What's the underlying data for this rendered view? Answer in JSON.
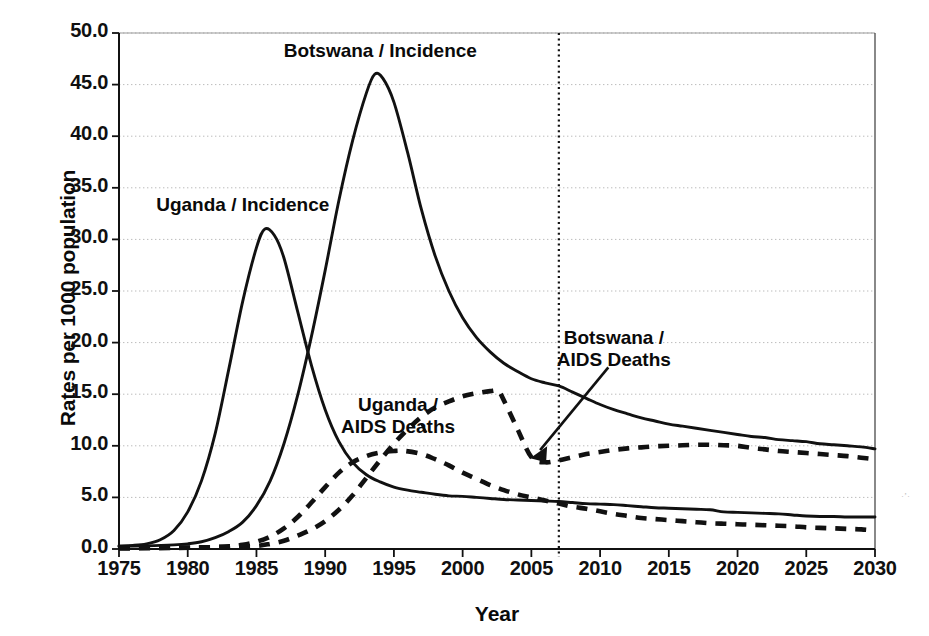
{
  "chart_data": {
    "type": "line",
    "title": "",
    "xlabel": "Year",
    "ylabel": "Rates per 1000 population",
    "xlim": [
      1975,
      2030
    ],
    "ylim": [
      0.0,
      50.0
    ],
    "xticks": [
      "1975",
      "1980",
      "1985",
      "1990",
      "1995",
      "2000",
      "2005",
      "2010",
      "2015",
      "2020",
      "2025",
      "2030"
    ],
    "yticks": [
      "0.0",
      "5.0",
      "10.0",
      "15.0",
      "20.0",
      "25.0",
      "30.0",
      "35.0",
      "40.0",
      "45.0",
      "50.0"
    ],
    "grid": true,
    "legend_position": "inline-annotations",
    "annotations": [
      {
        "name": "uganda-incidence-label",
        "text_lines": [
          "Uganda / Incidence"
        ],
        "x_year": 1984.0,
        "y_value": 33.3,
        "has_leader": false
      },
      {
        "name": "botswana-incidence-label",
        "text_lines": [
          "Botswana / Incidence"
        ],
        "x_year": 1994.0,
        "y_value": 48.3,
        "has_leader": false
      },
      {
        "name": "uganda-aids-deaths-label",
        "text_lines": [
          "Uganda /",
          "AIDS Deaths"
        ],
        "x_year": 1995.3,
        "y_value": 12.9,
        "has_leader": true
      },
      {
        "name": "botswana-aids-deaths-label",
        "text_lines": [
          "Botswana /",
          "AIDS Deaths"
        ],
        "x_year": 2011.0,
        "y_value": 19.4,
        "has_leader": true,
        "leader_target_year": 2005.2,
        "leader_target_value": 8.9
      }
    ],
    "marker_line": {
      "name": "projection-start-line",
      "x_year": 2007,
      "style": "dotted",
      "color": "#111111"
    },
    "series": [
      {
        "name": "Botswana / Incidence",
        "style": "solid",
        "color": "#111111",
        "points": [
          [
            1975,
            0.25
          ],
          [
            1977,
            0.3
          ],
          [
            1979,
            0.4
          ],
          [
            1980,
            0.5
          ],
          [
            1981,
            0.7
          ],
          [
            1982,
            1.1
          ],
          [
            1983,
            1.7
          ],
          [
            1984,
            2.6
          ],
          [
            1985,
            4.2
          ],
          [
            1986,
            6.6
          ],
          [
            1987,
            10.2
          ],
          [
            1988,
            14.9
          ],
          [
            1989,
            20.6
          ],
          [
            1990,
            27.0
          ],
          [
            1991,
            33.8
          ],
          [
            1992,
            39.6
          ],
          [
            1993,
            44.2
          ],
          [
            1993.6,
            46.0
          ],
          [
            1994.2,
            45.6
          ],
          [
            1995,
            43.3
          ],
          [
            1996,
            38.4
          ],
          [
            1997,
            32.9
          ],
          [
            1998,
            28.4
          ],
          [
            1999,
            25.0
          ],
          [
            2000,
            22.4
          ],
          [
            2001,
            20.5
          ],
          [
            2002,
            19.1
          ],
          [
            2003,
            18.0
          ],
          [
            2004,
            17.2
          ],
          [
            2005,
            16.5
          ],
          [
            2006,
            16.1
          ],
          [
            2007,
            15.8
          ],
          [
            2008,
            15.2
          ],
          [
            2009,
            14.6
          ],
          [
            2010,
            14.0
          ],
          [
            2011,
            13.5
          ],
          [
            2012,
            13.1
          ],
          [
            2013,
            12.7
          ],
          [
            2014,
            12.4
          ],
          [
            2015,
            12.1
          ],
          [
            2016,
            11.9
          ],
          [
            2017,
            11.7
          ],
          [
            2018,
            11.5
          ],
          [
            2019,
            11.3
          ],
          [
            2020,
            11.1
          ],
          [
            2021,
            10.9
          ],
          [
            2022,
            10.8
          ],
          [
            2023,
            10.6
          ],
          [
            2024,
            10.5
          ],
          [
            2025,
            10.4
          ],
          [
            2026,
            10.2
          ],
          [
            2027,
            10.1
          ],
          [
            2028,
            10.0
          ],
          [
            2029,
            9.9
          ],
          [
            2030,
            9.7
          ]
        ]
      },
      {
        "name": "Uganda / Incidence",
        "style": "solid",
        "color": "#111111",
        "points": [
          [
            1975,
            0.3
          ],
          [
            1976,
            0.35
          ],
          [
            1977,
            0.5
          ],
          [
            1978,
            0.9
          ],
          [
            1979,
            1.8
          ],
          [
            1980,
            3.6
          ],
          [
            1981,
            6.6
          ],
          [
            1982,
            11.2
          ],
          [
            1983,
            17.5
          ],
          [
            1984,
            24.0
          ],
          [
            1985,
            29.2
          ],
          [
            1985.6,
            31.0
          ],
          [
            1986.3,
            30.4
          ],
          [
            1987,
            28.2
          ],
          [
            1988,
            23.0
          ],
          [
            1989,
            17.8
          ],
          [
            1990,
            13.5
          ],
          [
            1991,
            10.4
          ],
          [
            1992,
            8.4
          ],
          [
            1993,
            7.2
          ],
          [
            1994,
            6.5
          ],
          [
            1995,
            6.0
          ],
          [
            1996,
            5.7
          ],
          [
            1997,
            5.5
          ],
          [
            1998,
            5.3
          ],
          [
            1999,
            5.15
          ],
          [
            2000,
            5.1
          ],
          [
            2001,
            5.0
          ],
          [
            2002,
            4.9
          ],
          [
            2003,
            4.8
          ],
          [
            2004,
            4.75
          ],
          [
            2005,
            4.7
          ],
          [
            2006,
            4.65
          ],
          [
            2007,
            4.6
          ],
          [
            2008,
            4.5
          ],
          [
            2009,
            4.4
          ],
          [
            2010,
            4.35
          ],
          [
            2011,
            4.3
          ],
          [
            2012,
            4.2
          ],
          [
            2013,
            4.1
          ],
          [
            2014,
            4.0
          ],
          [
            2015,
            3.95
          ],
          [
            2016,
            3.9
          ],
          [
            2017,
            3.85
          ],
          [
            2018,
            3.8
          ],
          [
            2019,
            3.6
          ],
          [
            2020,
            3.55
          ],
          [
            2021,
            3.5
          ],
          [
            2022,
            3.45
          ],
          [
            2023,
            3.4
          ],
          [
            2024,
            3.3
          ],
          [
            2025,
            3.2
          ],
          [
            2026,
            3.15
          ],
          [
            2027,
            3.15
          ],
          [
            2028,
            3.1
          ],
          [
            2029,
            3.1
          ],
          [
            2030,
            3.1
          ]
        ]
      },
      {
        "name": "Botswana / AIDS Deaths",
        "style": "dashed",
        "color": "#111111",
        "points": [
          [
            1975,
            0.1
          ],
          [
            1980,
            0.15
          ],
          [
            1983,
            0.2
          ],
          [
            1985,
            0.3
          ],
          [
            1986,
            0.5
          ],
          [
            1987,
            0.8
          ],
          [
            1988,
            1.3
          ],
          [
            1989,
            1.9
          ],
          [
            1990,
            2.7
          ],
          [
            1991,
            3.8
          ],
          [
            1992,
            5.2
          ],
          [
            1993,
            6.9
          ],
          [
            1994,
            8.6
          ],
          [
            1995,
            10.2
          ],
          [
            1996,
            11.6
          ],
          [
            1997,
            12.8
          ],
          [
            1998,
            13.7
          ],
          [
            1999,
            14.3
          ],
          [
            2000,
            14.8
          ],
          [
            2001,
            15.1
          ],
          [
            2002,
            15.3
          ],
          [
            2002.6,
            15.3
          ],
          [
            2003,
            14.4
          ],
          [
            2004,
            11.6
          ],
          [
            2005,
            8.9
          ],
          [
            2006,
            8.4
          ],
          [
            2007,
            8.6
          ],
          [
            2008,
            8.9
          ],
          [
            2009,
            9.2
          ],
          [
            2010,
            9.4
          ],
          [
            2011,
            9.6
          ],
          [
            2012,
            9.75
          ],
          [
            2013,
            9.85
          ],
          [
            2014,
            9.95
          ],
          [
            2015,
            10.0
          ],
          [
            2016,
            10.05
          ],
          [
            2017,
            10.1
          ],
          [
            2018,
            10.1
          ],
          [
            2019,
            10.05
          ],
          [
            2020,
            10.0
          ],
          [
            2021,
            9.8
          ],
          [
            2022,
            9.65
          ],
          [
            2023,
            9.5
          ],
          [
            2024,
            9.4
          ],
          [
            2025,
            9.3
          ],
          [
            2026,
            9.2
          ],
          [
            2027,
            9.1
          ],
          [
            2028,
            9.0
          ],
          [
            2029,
            8.85
          ],
          [
            2030,
            8.7
          ]
        ]
      },
      {
        "name": "Uganda / AIDS Deaths",
        "style": "dashed",
        "color": "#111111",
        "points": [
          [
            1975,
            0.05
          ],
          [
            1979,
            0.1
          ],
          [
            1981,
            0.15
          ],
          [
            1983,
            0.25
          ],
          [
            1984,
            0.4
          ],
          [
            1985,
            0.7
          ],
          [
            1986,
            1.2
          ],
          [
            1987,
            2.0
          ],
          [
            1988,
            3.1
          ],
          [
            1989,
            4.5
          ],
          [
            1990,
            6.0
          ],
          [
            1991,
            7.4
          ],
          [
            1992,
            8.4
          ],
          [
            1993,
            9.0
          ],
          [
            1994,
            9.35
          ],
          [
            1995,
            9.5
          ],
          [
            1995.8,
            9.5
          ],
          [
            1997,
            9.2
          ],
          [
            1998,
            8.7
          ],
          [
            1999,
            8.1
          ],
          [
            2000,
            7.4
          ],
          [
            2001,
            6.8
          ],
          [
            2002,
            6.2
          ],
          [
            2003,
            5.7
          ],
          [
            2004,
            5.3
          ],
          [
            2005,
            5.0
          ],
          [
            2006,
            4.7
          ],
          [
            2007,
            4.4
          ],
          [
            2008,
            4.1
          ],
          [
            2009,
            3.9
          ],
          [
            2010,
            3.65
          ],
          [
            2011,
            3.4
          ],
          [
            2012,
            3.2
          ],
          [
            2013,
            3.0
          ],
          [
            2014,
            2.9
          ],
          [
            2015,
            2.8
          ],
          [
            2016,
            2.7
          ],
          [
            2017,
            2.6
          ],
          [
            2018,
            2.5
          ],
          [
            2019,
            2.45
          ],
          [
            2020,
            2.4
          ],
          [
            2021,
            2.35
          ],
          [
            2022,
            2.3
          ],
          [
            2023,
            2.25
          ],
          [
            2024,
            2.2
          ],
          [
            2025,
            2.1
          ],
          [
            2026,
            2.05
          ],
          [
            2027,
            2.0
          ],
          [
            2028,
            1.95
          ],
          [
            2029,
            1.9
          ],
          [
            2030,
            1.8
          ]
        ]
      }
    ]
  },
  "colors": {
    "axis": "#111111",
    "grid": "#bbbbbb",
    "text": "#0a0a0a",
    "background": "#ffffff"
  },
  "artifacts": {
    "edge_mark": "·ʼ·"
  }
}
